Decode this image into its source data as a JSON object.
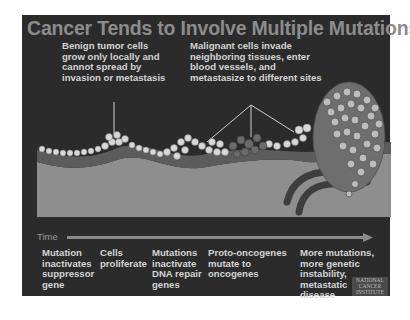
{
  "slide": {
    "title": "Cancer Tends to Involve Multiple Mutations",
    "annotations": {
      "benign": [
        "Benign tumor cells",
        "grow only locally and",
        "cannot spread by",
        "invasion or metastasis"
      ],
      "malignant": [
        "Malignant cells invade",
        "neighboring tissues, enter",
        "blood vessels, and",
        "metastasize to different sites"
      ]
    },
    "timeline": {
      "label": "Time"
    },
    "steps": [
      {
        "lines": [
          "Mutation",
          "inactivates",
          "suppressor",
          "gene"
        ]
      },
      {
        "lines": [
          "Cells",
          "proliferate"
        ]
      },
      {
        "lines": [
          "Mutations",
          "inactivate",
          "DNA repair",
          "genes"
        ]
      },
      {
        "lines": [
          "Proto-oncogenes",
          "mutate to",
          "oncogenes"
        ]
      },
      {
        "lines": [
          "More mutations,",
          "more genetic",
          "instability,",
          "metastatic",
          "disease"
        ]
      }
    ],
    "logo": [
      "NATIONAL",
      "CANCER",
      "INSTITUTE"
    ],
    "colors": {
      "background": "#2b2b2b",
      "title": "#8c8c8c",
      "text": "#d4d4d4",
      "tissue": "#8e8e8e",
      "membrane": "#5a5a5a",
      "cells": "#d8d8d8"
    }
  }
}
